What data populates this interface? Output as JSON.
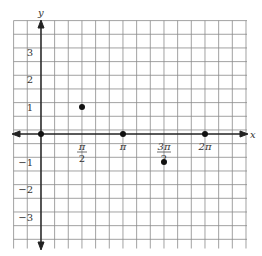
{
  "chart_data": {
    "type": "scatter",
    "title": "",
    "xlabel": "x",
    "ylabel": "y",
    "x_tick_labels": [
      {
        "value": "pi/2",
        "num": "π",
        "den": "2"
      },
      {
        "value": "pi",
        "num": "π",
        "den": ""
      },
      {
        "value": "3pi/2",
        "num": "3π",
        "den": "2"
      },
      {
        "value": "2pi",
        "num": "2π",
        "den": ""
      }
    ],
    "y_tick_labels": [
      "3",
      "2",
      "1",
      "−1",
      "−2",
      "−3"
    ],
    "xlim": [
      "-pi/3",
      "2pi+pi/3"
    ],
    "ylim": [
      -4,
      4
    ],
    "grid": true,
    "points": [
      {
        "x": "0",
        "y": 0
      },
      {
        "x": "pi/2",
        "y": 1
      },
      {
        "x": "pi",
        "y": 0
      },
      {
        "x": "3pi/2",
        "y": -1
      },
      {
        "x": "2pi",
        "y": 0
      }
    ]
  },
  "axes": {
    "x_label": "x",
    "y_label": "y"
  },
  "ticks": {
    "x": {
      "pi_half_num": "π",
      "pi_half_den": "2",
      "pi": "π",
      "three_pi_half_num": "3π",
      "three_pi_half_den": "2",
      "two_pi": "2π"
    },
    "y": {
      "p3": "3",
      "p2": "2",
      "p1": "1",
      "m1": "−1",
      "m2": "−2",
      "m3": "−3"
    }
  }
}
